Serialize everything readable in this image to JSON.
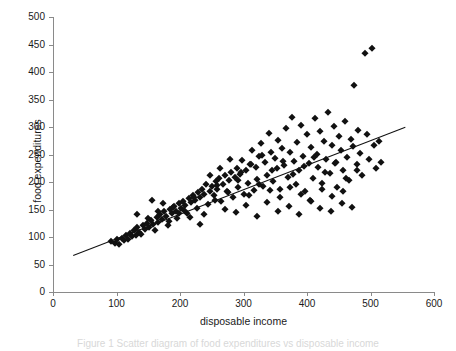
{
  "figure": {
    "caption": "Figure 1 Scatter diagram of food expenditures vs disposable income"
  },
  "chart_data": {
    "type": "scatter",
    "title": "",
    "xlabel": "disposable income",
    "ylabel": "food expenditures",
    "xlim": [
      0,
      600
    ],
    "ylim": [
      0,
      500
    ],
    "xticks": [
      0,
      100,
      200,
      300,
      400,
      500,
      600
    ],
    "yticks": [
      0,
      50,
      100,
      150,
      200,
      250,
      300,
      350,
      400,
      450,
      500
    ],
    "grid": false,
    "legend": null,
    "marker": "diamond",
    "marker_color": "#111111",
    "axis_color": "#8a8a8a",
    "trendline": {
      "name": "least-squares fit",
      "x": [
        31,
        554
      ],
      "y": [
        67,
        300
      ],
      "color": "#111111"
    },
    "series": [
      {
        "name": "households",
        "points": [
          [
            92,
            92
          ],
          [
            97,
            90
          ],
          [
            101,
            96
          ],
          [
            104,
            88
          ],
          [
            108,
            99
          ],
          [
            112,
            94
          ],
          [
            115,
            103
          ],
          [
            118,
            97
          ],
          [
            121,
            107
          ],
          [
            124,
            101
          ],
          [
            127,
            112
          ],
          [
            130,
            104
          ],
          [
            133,
            118
          ],
          [
            136,
            110
          ],
          [
            139,
            106
          ],
          [
            142,
            122
          ],
          [
            145,
            115
          ],
          [
            148,
            126
          ],
          [
            151,
            119
          ],
          [
            154,
            131
          ],
          [
            157,
            124
          ],
          [
            160,
            113
          ],
          [
            163,
            136
          ],
          [
            166,
            128
          ],
          [
            169,
            142
          ],
          [
            172,
            133
          ],
          [
            175,
            147
          ],
          [
            178,
            138
          ],
          [
            181,
            121
          ],
          [
            184,
            151
          ],
          [
            187,
            143
          ],
          [
            190,
            156
          ],
          [
            193,
            148
          ],
          [
            196,
            134
          ],
          [
            199,
            161
          ],
          [
            202,
            153
          ],
          [
            205,
            166
          ],
          [
            208,
            158
          ],
          [
            211,
            144
          ],
          [
            214,
            171
          ],
          [
            217,
            163
          ],
          [
            220,
            177
          ],
          [
            223,
            168
          ],
          [
            226,
            152
          ],
          [
            229,
            182
          ],
          [
            232,
            173
          ],
          [
            235,
            188
          ],
          [
            238,
            179
          ],
          [
            241,
            196
          ],
          [
            244,
            160
          ],
          [
            247,
            184
          ],
          [
            250,
            193
          ],
          [
            253,
            176
          ],
          [
            256,
            201
          ],
          [
            259,
            188
          ],
          [
            262,
            207
          ],
          [
            265,
            166
          ],
          [
            268,
            197
          ],
          [
            271,
            213
          ],
          [
            274,
            183
          ],
          [
            277,
            204
          ],
          [
            280,
            219
          ],
          [
            283,
            172
          ],
          [
            286,
            209
          ],
          [
            289,
            226
          ],
          [
            292,
            191
          ],
          [
            295,
            215
          ],
          [
            298,
            240
          ],
          [
            301,
            178
          ],
          [
            304,
            221
          ],
          [
            307,
            198
          ],
          [
            310,
            232
          ],
          [
            313,
            258
          ],
          [
            316,
            186
          ],
          [
            319,
            227
          ],
          [
            322,
            205
          ],
          [
            325,
            247
          ],
          [
            328,
            271
          ],
          [
            331,
            193
          ],
          [
            334,
            236
          ],
          [
            337,
            213
          ],
          [
            340,
            289
          ],
          [
            343,
            254
          ],
          [
            346,
            201
          ],
          [
            349,
            244
          ],
          [
            352,
            225
          ],
          [
            355,
            276
          ],
          [
            358,
            188
          ],
          [
            361,
            262
          ],
          [
            364,
            231
          ],
          [
            367,
            298
          ],
          [
            370,
            209
          ],
          [
            373,
            255
          ],
          [
            376,
            318
          ],
          [
            379,
            238
          ],
          [
            382,
            196
          ],
          [
            385,
            272
          ],
          [
            388,
            221
          ],
          [
            391,
            303
          ],
          [
            394,
            247
          ],
          [
            397,
            184
          ],
          [
            400,
            287
          ],
          [
            403,
            234
          ],
          [
            406,
            264
          ],
          [
            409,
            207
          ],
          [
            412,
            316
          ],
          [
            415,
            251
          ],
          [
            418,
            228
          ],
          [
            421,
            293
          ],
          [
            424,
            199
          ],
          [
            427,
            275
          ],
          [
            430,
            242
          ],
          [
            433,
            327
          ],
          [
            436,
            216
          ],
          [
            439,
            268
          ],
          [
            442,
            302
          ],
          [
            445,
            236
          ],
          [
            448,
            191
          ],
          [
            451,
            284
          ],
          [
            454,
            258
          ],
          [
            457,
            221
          ],
          [
            460,
            311
          ],
          [
            463,
            246
          ],
          [
            466,
            204
          ],
          [
            469,
            279
          ],
          [
            472,
            265
          ],
          [
            474,
            377
          ],
          [
            478,
            232
          ],
          [
            481,
            295
          ],
          [
            484,
            253
          ],
          [
            487,
            213
          ],
          [
            491,
            435
          ],
          [
            494,
            288
          ],
          [
            497,
            241
          ],
          [
            502,
            443
          ],
          [
            505,
            268
          ],
          [
            509,
            226
          ],
          [
            513,
            274
          ],
          [
            517,
            236
          ],
          [
            156,
            168
          ],
          [
            173,
            162
          ],
          [
            189,
            155
          ],
          [
            206,
            149
          ],
          [
            222,
            173
          ],
          [
            238,
            142
          ],
          [
            255,
            167
          ],
          [
            271,
            151
          ],
          [
            288,
            146
          ],
          [
            304,
            159
          ],
          [
            321,
            138
          ],
          [
            337,
            163
          ],
          [
            354,
            148
          ],
          [
            371,
            157
          ],
          [
            388,
            141
          ],
          [
            404,
            168
          ],
          [
            421,
            152
          ],
          [
            438,
            147
          ],
          [
            455,
            161
          ],
          [
            471,
            155
          ],
          [
            247,
            213
          ],
          [
            263,
            226
          ],
          [
            279,
            241
          ],
          [
            296,
            218
          ],
          [
            312,
            233
          ],
          [
            329,
            249
          ],
          [
            345,
            222
          ],
          [
            362,
            238
          ],
          [
            378,
            214
          ],
          [
            395,
            229
          ],
          [
            411,
            245
          ],
          [
            428,
            219
          ],
          [
            444,
            234
          ],
          [
            461,
            207
          ],
          [
            478,
            222
          ],
          [
            133,
            141
          ],
          [
            149,
            134
          ],
          [
            165,
            147
          ],
          [
            182,
            129
          ],
          [
            198,
            143
          ],
          [
            215,
            136
          ],
          [
            231,
            124
          ],
          [
            258,
            194
          ],
          [
            275,
            182
          ],
          [
            291,
            203
          ],
          [
            308,
            176
          ],
          [
            324,
            197
          ],
          [
            341,
            186
          ],
          [
            357,
            172
          ],
          [
            374,
            191
          ],
          [
            390,
            179
          ],
          [
            407,
            166
          ],
          [
            424,
            188
          ],
          [
            440,
            174
          ],
          [
            457,
            183
          ]
        ]
      }
    ]
  }
}
